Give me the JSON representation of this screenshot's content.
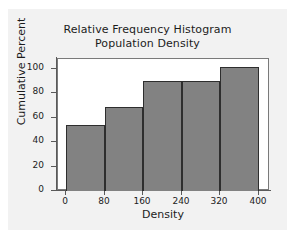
{
  "chart_data": {
    "type": "bar",
    "title": "Relative Frequency Histogram",
    "subtitle": "Population Density",
    "xlabel": "Density",
    "ylabel": "Cumulative Percent",
    "categories": [
      "0-80",
      "80-160",
      "160-240",
      "240-320",
      "320-400"
    ],
    "bin_edges": [
      0,
      80,
      160,
      240,
      320,
      400
    ],
    "values": [
      54,
      69,
      90,
      90,
      102
    ],
    "xlim": [
      0,
      400
    ],
    "ylim": [
      0,
      100
    ],
    "x_ticks": [
      "0",
      "80",
      "160",
      "240",
      "320",
      "400"
    ],
    "x_tick_values": [
      0,
      80,
      160,
      240,
      320,
      400
    ],
    "y_ticks": [
      "0",
      "20",
      "40",
      "60",
      "80",
      "100"
    ],
    "y_tick_values": [
      0,
      20,
      40,
      60,
      80,
      100
    ],
    "grid": false,
    "legend": false,
    "bar_color": "#828282",
    "bar_edge_color": "#2e2e2e",
    "plot_background": "#ffffff",
    "figure_background": "#f2f2f2"
  }
}
